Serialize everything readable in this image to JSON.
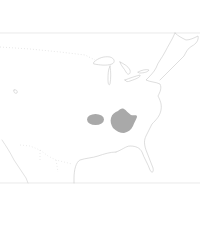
{
  "map": {
    "type": "range-map",
    "region": "Eastern United States",
    "colors": {
      "background": "#ffffff",
      "outline": "#c8c8c8",
      "border": "#d4d4d4",
      "range_fill": "#a9a9a9"
    },
    "range_areas": [
      {
        "name": "western-range-patch",
        "shape": "oval"
      },
      {
        "name": "eastern-range-patch",
        "shape": "irregular"
      }
    ]
  }
}
